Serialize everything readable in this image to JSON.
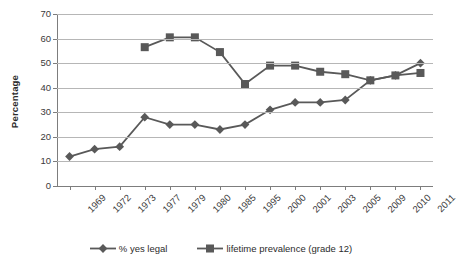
{
  "chart_data": {
    "type": "line",
    "title": "",
    "xlabel": "",
    "ylabel": "Percentage",
    "ylim": [
      0,
      70
    ],
    "ytick_step": 10,
    "yticks": [
      0,
      10,
      20,
      30,
      40,
      50,
      60,
      70
    ],
    "grid": true,
    "legend_position": "bottom",
    "categories": [
      "1969",
      "1972",
      "1973",
      "1977",
      "1979",
      "1980",
      "1985",
      "1995",
      "2000",
      "2001",
      "2003",
      "2005",
      "2009",
      "2010",
      "2011"
    ],
    "series": [
      {
        "name": "% yes legal",
        "marker": "diamond",
        "color": "#595959",
        "values": [
          12,
          15,
          16,
          28,
          25,
          25,
          23,
          25,
          31,
          34,
          34,
          35,
          43,
          45,
          50
        ]
      },
      {
        "name": "lifetime prevalence (grade 12)",
        "marker": "square",
        "color": "#595959",
        "values": [
          null,
          null,
          null,
          56.5,
          60.5,
          60.5,
          54.5,
          41.5,
          49,
          49,
          46.5,
          45.5,
          43,
          45,
          46
        ]
      }
    ]
  },
  "axis": {
    "y_title": "Percentage",
    "y_labels": [
      "70",
      "60",
      "50",
      "40",
      "30",
      "20",
      "10",
      "0"
    ],
    "x_labels": [
      "1969",
      "1972",
      "1973",
      "1977",
      "1979",
      "1980",
      "1985",
      "1995",
      "2000",
      "2001",
      "2003",
      "2005",
      "2009",
      "2010",
      "2011"
    ]
  },
  "legend": {
    "items": [
      {
        "label": "% yes legal",
        "marker": "diamond-marker-icon"
      },
      {
        "label": "lifetime prevalence (grade 12)",
        "marker": "square-marker-icon"
      }
    ]
  },
  "colors": {
    "series": "#595959",
    "gridline": "#b6b6b6",
    "axis": "#7d7d7d",
    "text": "#3a3a3a"
  }
}
